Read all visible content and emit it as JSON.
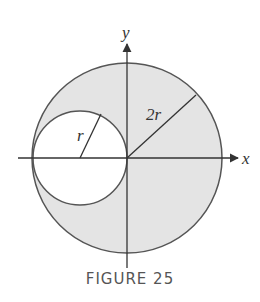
{
  "figure": {
    "caption": "FIGURE 25",
    "labels": {
      "x_axis": "x",
      "y_axis": "y",
      "large_radius": "2r",
      "small_radius": "r"
    },
    "colors": {
      "shade": "#e4e4e4",
      "stroke": "#555555",
      "axis": "#333333",
      "background": "#ffffff"
    },
    "geometry": {
      "large_circle": {
        "cx": 127,
        "cy": 158,
        "r": 95
      },
      "small_circle": {
        "cx": 80,
        "cy": 158,
        "r": 47
      }
    }
  }
}
